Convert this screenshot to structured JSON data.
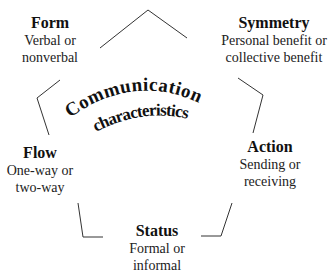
{
  "diagram": {
    "center": {
      "line1": "Communication",
      "line2": "characteristics"
    },
    "nodes": [
      {
        "id": "form",
        "title": "Form",
        "desc_line1": "Verbal or",
        "desc_line2": "nonverbal"
      },
      {
        "id": "symmetry",
        "title": "Symmetry",
        "desc_line1": "Personal benefit or",
        "desc_line2": "collective benefit"
      },
      {
        "id": "action",
        "title": "Action",
        "desc_line1": "Sending or",
        "desc_line2": "receiving"
      },
      {
        "id": "status",
        "title": "Status",
        "desc_line1": "Formal or",
        "desc_line2": "informal"
      },
      {
        "id": "flow",
        "title": "Flow",
        "desc_line1": "One-way or",
        "desc_line2": "two-way"
      }
    ],
    "colors": {
      "line": "#333333",
      "text": "#111111",
      "background": "#ffffff"
    }
  }
}
